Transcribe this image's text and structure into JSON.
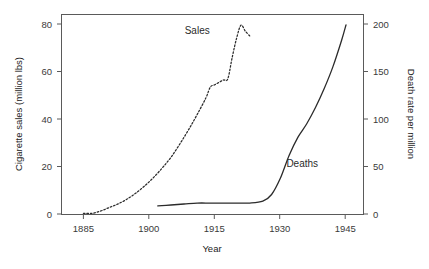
{
  "chart_data": {
    "type": "line",
    "title": "",
    "subtitle": "",
    "xlabel": "Year",
    "ylabel": "Cigarette sales (million lbs)",
    "y2label": "Death rate per million",
    "xlim": [
      1880,
      1949
    ],
    "ylim": [
      0,
      84
    ],
    "y2lim": [
      0,
      210
    ],
    "grid": false,
    "legend_position": "inline-annotations",
    "xticks": [
      1885,
      1900,
      1915,
      1930,
      1945
    ],
    "xtick_labels": [
      "1885",
      "1900",
      "1915",
      "1930",
      "1945"
    ],
    "yticks": [
      0,
      20,
      40,
      60,
      80
    ],
    "ytick_labels": [
      "0",
      "20",
      "40",
      "60",
      "80"
    ],
    "y2ticks": [
      0,
      50,
      100,
      150,
      200
    ],
    "y2tick_labels": [
      "0",
      "50",
      "100",
      "150",
      "200"
    ],
    "annotations": [
      {
        "text": "Sales",
        "x": 1911,
        "y": 76,
        "axis": "left"
      },
      {
        "text": "Deaths",
        "x": 1935,
        "y": 20,
        "axis": "left"
      }
    ],
    "series": [
      {
        "name": "Sales",
        "label": "Sales",
        "axis": "left",
        "style": "dashed",
        "color": "#2b2b2b",
        "units": "million lbs",
        "x": [
          1885,
          1887,
          1889,
          1891,
          1893,
          1895,
          1897,
          1899,
          1901,
          1903,
          1905,
          1907,
          1909,
          1911,
          1913,
          1914,
          1915,
          1916,
          1917,
          1918,
          1919,
          1920,
          1921,
          1922,
          1923
        ],
        "values": [
          0.5,
          0.5,
          1.5,
          3.0,
          4.5,
          6.5,
          9.0,
          12.0,
          15.5,
          19.5,
          24.0,
          29.5,
          35.5,
          42.0,
          49.0,
          53.5,
          54.5,
          55.5,
          56.5,
          57.0,
          66.0,
          74.0,
          79.5,
          77.0,
          75.0
        ]
      },
      {
        "name": "Deaths",
        "label": "Deaths",
        "axis": "right",
        "style": "solid",
        "color": "#2b2b2b",
        "units": "death rate per million",
        "x": [
          1902,
          1905,
          1908,
          1911,
          1914,
          1917,
          1920,
          1923,
          1926,
          1928,
          1930,
          1932,
          1934,
          1936,
          1938,
          1940,
          1942,
          1944,
          1945
        ],
        "values": [
          9,
          10,
          11,
          12,
          12,
          12,
          12,
          12,
          14,
          21,
          38,
          62,
          81,
          95,
          112,
          132,
          155,
          183,
          199
        ]
      }
    ]
  }
}
